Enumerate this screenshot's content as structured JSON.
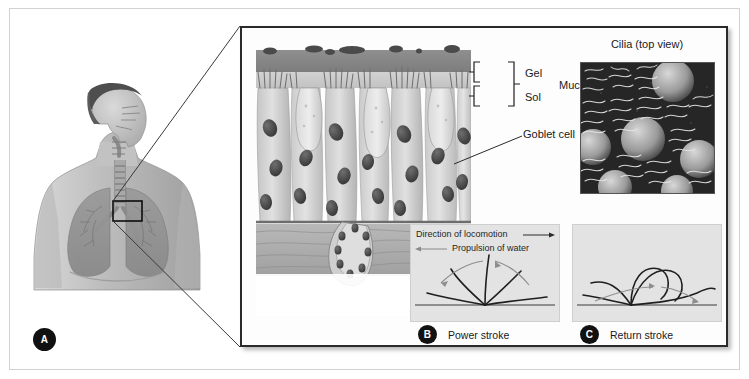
{
  "figure": {
    "type": "biology-illustration"
  },
  "panel_a": {
    "badge": "A",
    "illustration": "human-torso-respiratory-tract",
    "description": "Grayscale anatomical drawing of head in profile and upper torso showing nasal cavity, pharynx, trachea and lungs, with a small black rectangular callout box over the tracheal region"
  },
  "magnified": {
    "illustration": "pseudostratified-ciliated-columnar-epithelium",
    "labels": {
      "gel": "Gel",
      "sol": "Sol",
      "mucous": "Mucous",
      "goblet_cell": "Goblet cell"
    }
  },
  "micrograph": {
    "title": "Cilia (top view)",
    "description": "Scanning electron micrograph of the apical epithelial surface showing dense cilia tufts and rounded goblet cell domes"
  },
  "stroke_panels": [
    {
      "badge": "B",
      "caption": "Power stroke",
      "annotations": {
        "locomotion": "Direction of locomotion",
        "locomotion_arrow": "arrow-right",
        "propulsion": "Propulsion of water",
        "propulsion_arrow": "arrow-left"
      }
    },
    {
      "badge": "C",
      "caption": "Return stroke",
      "annotations": {}
    }
  ],
  "colors": {
    "page_background": "#ffffff",
    "page_border": "#d2d2d2",
    "panel_border": "#2a2a2a",
    "badge": "#111111",
    "badge_text": "#ffffff",
    "stroke_panel_background": "#e3e3e3",
    "gel_layer": "#8a8a8a",
    "sol_layer": "#c9c9c9",
    "micrograph_background": "#2c2c2c",
    "label_text": "#1a1a1a"
  }
}
